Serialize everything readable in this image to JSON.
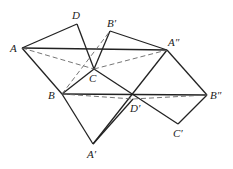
{
  "diagram": {
    "points": {
      "A": {
        "label": "A",
        "x": 22,
        "y": 48,
        "lx": 10,
        "ly": 52
      },
      "D": {
        "label": "D",
        "x": 77,
        "y": 24,
        "lx": 72,
        "ly": 19
      },
      "B1": {
        "label": "B′",
        "x": 110,
        "y": 31,
        "lx": 107,
        "ly": 27
      },
      "A2": {
        "label": "A″",
        "x": 167,
        "y": 50,
        "lx": 168,
        "ly": 46
      },
      "C": {
        "label": "C",
        "x": 94,
        "y": 69,
        "lx": 89,
        "ly": 82
      },
      "B": {
        "label": "B",
        "x": 62,
        "y": 94,
        "lx": 48,
        "ly": 99
      },
      "D1": {
        "label": "D′",
        "x": 133,
        "y": 99,
        "lx": 130,
        "ly": 112
      },
      "B2": {
        "label": "B″",
        "x": 207,
        "y": 95,
        "lx": 210,
        "ly": 99
      },
      "C1": {
        "label": "C′",
        "x": 178,
        "y": 124,
        "lx": 173,
        "ly": 137
      },
      "A1": {
        "label": "A′",
        "x": 93,
        "y": 144,
        "lx": 87,
        "ly": 158
      }
    },
    "solid_segments": [
      [
        "A",
        "D"
      ],
      [
        "D",
        "C"
      ],
      [
        "A",
        "A2"
      ],
      [
        "A",
        "B"
      ],
      [
        "B1",
        "C"
      ],
      [
        "B1",
        "A2"
      ],
      [
        "B",
        "C"
      ],
      [
        "C",
        "C1"
      ],
      [
        "B",
        "B2"
      ],
      [
        "A2",
        "A1"
      ],
      [
        "A2",
        "B2"
      ],
      [
        "B2",
        "C1"
      ],
      [
        "B",
        "A1"
      ]
    ],
    "dashed_segments": [
      [
        "A",
        "A2"
      ],
      [
        "B",
        "B1"
      ],
      [
        "B",
        "B2"
      ]
    ],
    "dashed_paths": [
      [
        "A",
        "C",
        "A2"
      ],
      [
        "B",
        "D1",
        "B2"
      ]
    ]
  }
}
